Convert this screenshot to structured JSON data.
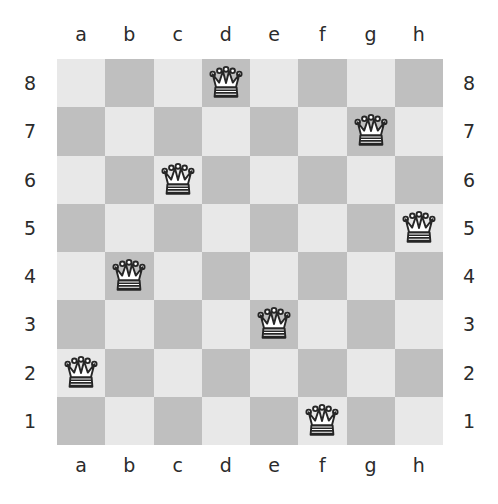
{
  "board": {
    "title": "Chessboard",
    "files": [
      "a",
      "b",
      "c",
      "d",
      "e",
      "f",
      "g",
      "h"
    ],
    "ranks": [
      "8",
      "7",
      "6",
      "5",
      "4",
      "3",
      "2",
      "1"
    ],
    "size": 8,
    "colors": {
      "light_square": "#e8e8e8",
      "dark_square": "#bfbfbf",
      "label_text": "#2b2b2b",
      "piece_outline": "#262626",
      "piece_fill": "#ffffff",
      "page_background": "#ffffff"
    },
    "orientation": "white-bottom",
    "pieces": [
      {
        "square": "a2",
        "file": "a",
        "rank": "2",
        "piece": "queen",
        "color": "white",
        "glyph": "white-queen-icon"
      },
      {
        "square": "b4",
        "file": "b",
        "rank": "4",
        "piece": "queen",
        "color": "white",
        "glyph": "white-queen-icon"
      },
      {
        "square": "c6",
        "file": "c",
        "rank": "6",
        "piece": "queen",
        "color": "white",
        "glyph": "white-queen-icon"
      },
      {
        "square": "d8",
        "file": "d",
        "rank": "8",
        "piece": "queen",
        "color": "white",
        "glyph": "white-queen-icon"
      },
      {
        "square": "e3",
        "file": "e",
        "rank": "3",
        "piece": "queen",
        "color": "white",
        "glyph": "white-queen-icon"
      },
      {
        "square": "f1",
        "file": "f",
        "rank": "1",
        "piece": "queen",
        "color": "white",
        "glyph": "white-queen-icon"
      },
      {
        "square": "g7",
        "file": "g",
        "rank": "7",
        "piece": "queen",
        "color": "white",
        "glyph": "white-queen-icon"
      },
      {
        "square": "h5",
        "file": "h",
        "rank": "5",
        "piece": "queen",
        "color": "white",
        "glyph": "white-queen-icon"
      }
    ],
    "piece_count": 8
  }
}
